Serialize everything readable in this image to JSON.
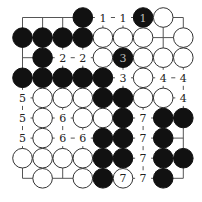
{
  "diagram": {
    "title": "",
    "size": 9,
    "origin": {
      "x": 22.5,
      "y": 17.5
    },
    "spacing": 20.1,
    "stone_radius": 9.8,
    "colors": {
      "background": "#ffffff",
      "grid": "#555555",
      "black_stone": "#111111",
      "white_stone": "#ffffff",
      "white_stone_border": "#333333",
      "label_on_black": "#bbbbbb",
      "label_text": "#222222"
    },
    "legend": "B = black stone, W = white stone, . = empty intersection; labels are move/marker numbers",
    "rows": [
      [
        ".",
        ".",
        ".",
        "B",
        ".",
        ".",
        "B",
        "W",
        "."
      ],
      [
        "B",
        "B",
        "B",
        "B",
        "W",
        "W",
        "W",
        ".",
        "W"
      ],
      [
        ".",
        "B",
        ".",
        ".",
        "W",
        "B",
        "W",
        "W",
        "W"
      ],
      [
        "B",
        "B",
        "B",
        "B",
        "B",
        ".",
        "W",
        ".",
        "."
      ],
      [
        ".",
        "W",
        "W",
        "W",
        "B",
        "B",
        "W",
        "W",
        "."
      ],
      [
        ".",
        "W",
        ".",
        "W",
        "W",
        "B",
        ".",
        "B",
        "B"
      ],
      [
        ".",
        "W",
        ".",
        ".",
        "B",
        "B",
        ".",
        "B",
        "."
      ],
      [
        "W",
        "W",
        "W",
        "W",
        "B",
        "B",
        ".",
        "B",
        "B"
      ],
      [
        ".",
        "W",
        ".",
        "W",
        "B",
        "W",
        ".",
        "B",
        "."
      ]
    ],
    "labels": [
      {
        "row": 0,
        "col": 4,
        "text": "1"
      },
      {
        "row": 0,
        "col": 5,
        "text": "1"
      },
      {
        "row": 0,
        "col": 6,
        "text": "1"
      },
      {
        "row": 2,
        "col": 2,
        "text": "2"
      },
      {
        "row": 2,
        "col": 3,
        "text": "2"
      },
      {
        "row": 2,
        "col": 5,
        "text": "3"
      },
      {
        "row": 3,
        "col": 5,
        "text": "3"
      },
      {
        "row": 3,
        "col": 7,
        "text": "4"
      },
      {
        "row": 3,
        "col": 8,
        "text": "4"
      },
      {
        "row": 4,
        "col": 8,
        "text": "4"
      },
      {
        "row": 4,
        "col": 0,
        "text": "5"
      },
      {
        "row": 5,
        "col": 0,
        "text": "5"
      },
      {
        "row": 6,
        "col": 0,
        "text": "5"
      },
      {
        "row": 5,
        "col": 2,
        "text": "6"
      },
      {
        "row": 6,
        "col": 2,
        "text": "6"
      },
      {
        "row": 6,
        "col": 3,
        "text": "6"
      },
      {
        "row": 5,
        "col": 6,
        "text": "7"
      },
      {
        "row": 6,
        "col": 6,
        "text": "7"
      },
      {
        "row": 7,
        "col": 6,
        "text": "7"
      },
      {
        "row": 8,
        "col": 6,
        "text": "7"
      },
      {
        "row": 8,
        "col": 5,
        "text": "7"
      }
    ]
  }
}
